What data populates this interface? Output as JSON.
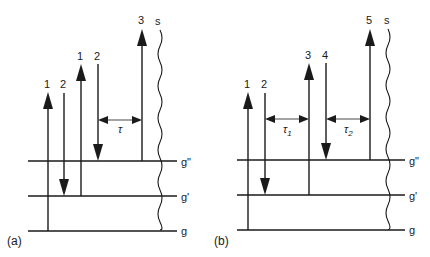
{
  "diagram": {
    "type": "energy-level-diagram",
    "colors": {
      "ink": "#1a1a1a",
      "background": "#ffffff"
    },
    "panels": [
      {
        "label": "(a)",
        "levels": [
          {
            "name": "g\"",
            "label": "g\""
          },
          {
            "name": "g'",
            "label": "g'"
          },
          {
            "name": "g",
            "label": "g"
          }
        ],
        "continuum_label": "s",
        "transitions": [
          {
            "label": "1",
            "direction": "up",
            "from": "g"
          },
          {
            "label": "2",
            "direction": "down",
            "to": "g'"
          },
          {
            "label": "1",
            "direction": "up",
            "from": "g'"
          },
          {
            "label": "2",
            "direction": "down",
            "to": "g\""
          },
          {
            "label": "3",
            "direction": "up",
            "from": "g\""
          }
        ],
        "delays": [
          {
            "label": "τ",
            "between": [
              "2",
              "3"
            ]
          }
        ]
      },
      {
        "label": "(b)",
        "levels": [
          {
            "name": "g\"",
            "label": "g\""
          },
          {
            "name": "g'",
            "label": "g'"
          },
          {
            "name": "g",
            "label": "g"
          }
        ],
        "continuum_label": "s",
        "transitions": [
          {
            "label": "1",
            "direction": "up",
            "from": "g"
          },
          {
            "label": "2",
            "direction": "down",
            "to": "g'"
          },
          {
            "label": "3",
            "direction": "up",
            "from": "g'"
          },
          {
            "label": "4",
            "direction": "down",
            "to": "g\""
          },
          {
            "label": "5",
            "direction": "up",
            "from": "g\""
          }
        ],
        "delays": [
          {
            "label": "τ",
            "sub": "1",
            "between": [
              "2",
              "3"
            ]
          },
          {
            "label": "τ",
            "sub": "2",
            "between": [
              "4",
              "5"
            ]
          }
        ]
      }
    ]
  }
}
